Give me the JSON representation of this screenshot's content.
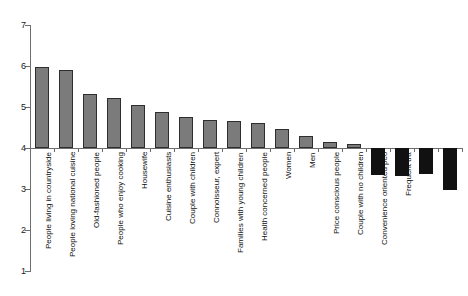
{
  "chart_data": {
    "type": "bar",
    "title": "",
    "subtitle": "",
    "xlabel": "",
    "ylabel": "",
    "ylim": [
      1,
      7
    ],
    "yticks": [
      1,
      2,
      3,
      4,
      5,
      6,
      7
    ],
    "ytick_labels": [
      "1",
      "2",
      "3",
      "4",
      "5",
      "6",
      "7"
    ],
    "grid": false,
    "legend": null,
    "baseline": 4,
    "note": "Bars are drawn from a baseline of 4; values above 4 render upward in grey, values below 4 render downward in black.",
    "categories": [
      "People living in countryside",
      "People loving national cuisine",
      "Old-fashioned people",
      "People who enjoy cooking",
      "Housewife",
      "Cuisine enthusiasts",
      "Couple with children",
      "Connoisseur, expert",
      "Families with young children",
      "Health concerned people",
      "Women",
      "Men",
      "Price conscious people",
      "Couple with no children",
      "Convenience oriented peo",
      "Frequent tra",
      "",
      ""
    ],
    "values": [
      5.98,
      5.9,
      5.32,
      5.22,
      5.05,
      4.89,
      4.76,
      4.68,
      4.65,
      4.6,
      4.46,
      4.3,
      4.14,
      4.1,
      3.34,
      3.32,
      3.36,
      2.98
    ],
    "series": [
      {
        "name": "Score",
        "values": [
          5.98,
          5.9,
          5.32,
          5.22,
          5.05,
          4.89,
          4.76,
          4.68,
          4.65,
          4.6,
          4.46,
          4.3,
          4.14,
          4.1,
          3.34,
          3.32,
          3.36,
          2.98
        ]
      }
    ],
    "colors": {
      "positive_bar_fill": "#7b7b7b",
      "positive_bar_edge": "#2e2e2e",
      "negative_bar_fill": "#111111",
      "axis": "#6e6e6e",
      "text": "#111111",
      "background": "#ffffff"
    }
  }
}
